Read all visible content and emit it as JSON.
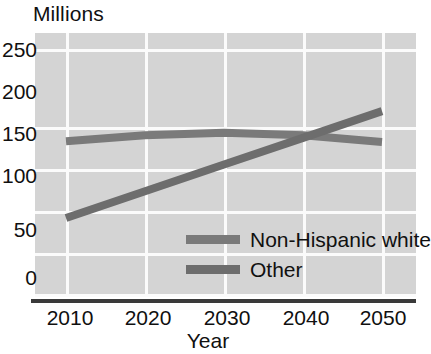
{
  "chart_data": {
    "type": "line",
    "title": "",
    "ylabel": "Millions",
    "xlabel": "Year",
    "x": [
      2010,
      2020,
      2030,
      2040,
      2050
    ],
    "xlim": [
      2010,
      2050
    ],
    "ylim": [
      0,
      265
    ],
    "yticks": [
      "250",
      "200",
      "150",
      "100",
      "50",
      "0"
    ],
    "ytick_values": [
      250,
      200,
      150,
      100,
      50,
      0
    ],
    "xticks": [
      "2010",
      "2020",
      "2030",
      "2040",
      "2050"
    ],
    "grid": "both",
    "legend_position": "inside-lower-right",
    "series": [
      {
        "name": "Non-Hispanic white",
        "color": "#7a7a7a",
        "values": [
          183,
          190,
          193,
          190,
          182
        ]
      },
      {
        "name": "Other",
        "color": "#6d6d6d",
        "values": [
          91,
          123,
          155,
          187,
          219
        ]
      }
    ]
  },
  "axes": {
    "y_unit_title": "Millions",
    "x_axis_title": "Year",
    "y_tick_labels": [
      "250",
      "200",
      "150",
      "100",
      "50",
      "0"
    ],
    "x_tick_labels": [
      "2010",
      "2020",
      "2030",
      "2040",
      "2050"
    ]
  },
  "legend": {
    "entries": [
      {
        "label": "Non-Hispanic white",
        "color": "#7a7a7a"
      },
      {
        "label": "Other",
        "color": "#6d6d6d"
      }
    ]
  },
  "colors": {
    "plot_background": "#d4d4d4",
    "gridline": "#fbfbfb",
    "axis_line": "#3a3a3a",
    "series_non_hispanic_white": "#7a7a7a",
    "series_other": "#6d6d6d",
    "text": "#101010"
  }
}
